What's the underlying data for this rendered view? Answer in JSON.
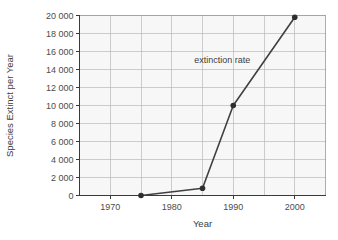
{
  "chart_data": {
    "type": "line",
    "title": "",
    "xlabel": "Year",
    "ylabel": "Species Extinct per Year",
    "xlim": [
      1965,
      2005
    ],
    "ylim": [
      0,
      20000
    ],
    "grid": true,
    "legend_position": "none",
    "x": [
      1975,
      1985,
      1990,
      2000
    ],
    "values": [
      0,
      800,
      10000,
      19800
    ],
    "series": [
      {
        "name": "extinction rate",
        "x": [
          1975,
          1985,
          1990,
          2000
        ],
        "values": [
          0,
          800,
          10000,
          19800
        ]
      }
    ],
    "xtick_values": [
      1970,
      1980,
      1990,
      2000
    ],
    "xtick_labels": [
      "1970",
      "1980",
      "1990",
      "2000"
    ],
    "x_gridline_values": [
      1970,
      1975,
      1980,
      1985,
      1990,
      1995,
      2000
    ],
    "ytick_values": [
      0,
      2000,
      4000,
      6000,
      8000,
      10000,
      12000,
      14000,
      16000,
      18000,
      20000
    ],
    "ytick_labels": [
      "0",
      "2 000",
      "4 000",
      "6 000",
      "8 000",
      "10 000",
      "12 000",
      "14 000",
      "16 000",
      "18 000",
      "20 000"
    ],
    "annotations": [
      {
        "name": "extinction-rate",
        "text": "extinction rate",
        "x": 1988.2,
        "y": 14700
      }
    ],
    "colors": {
      "line": "#404040",
      "marker": "#2e2e2e",
      "gridline": "#b9b9b9",
      "plot_background": "#f7f7f7",
      "axis": "#3a3a3a",
      "text": "#4c4c4c",
      "page_background": "#ffffff"
    }
  }
}
